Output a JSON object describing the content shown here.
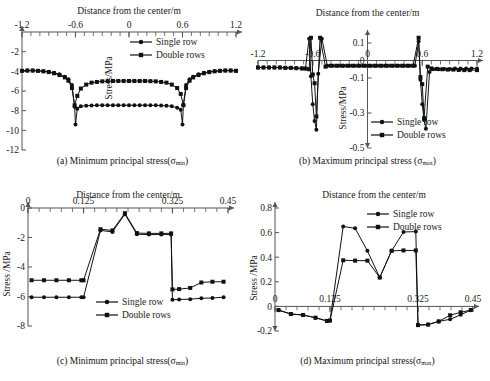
{
  "figure": {
    "background": "#ffffff",
    "line_color": "#111111",
    "axis_color": "#555555",
    "marker_single": "circle",
    "marker_double": "square"
  },
  "legend": {
    "single": "Single row",
    "double": "Double rows"
  },
  "captions": {
    "a": "(a) Minimum principal stress(σ",
    "a_sub": "min",
    "a_end": ")",
    "b": "(b) Maximum principal stress (σ",
    "b_sub": "max",
    "b_end": ")",
    "c": "(c) Minimum principal stress(σ",
    "c_sub": "min",
    "c_end": ")",
    "d": "(d) Maximum principal stress(σ",
    "d_sub": "max",
    "d_end": ")"
  },
  "chart_data": [
    {
      "id": "a",
      "type": "line",
      "title": "Distance from the center/m",
      "xlabel": "Distance from the center/m",
      "ylabel": "Stress/MPa",
      "xlim": [
        -1.2,
        1.2
      ],
      "ylim": [
        -12,
        0
      ],
      "xticks": [
        -1.2,
        -0.6,
        0,
        0.6,
        1.2
      ],
      "xticklabels": [
        "-1.2",
        "-0.6",
        "0",
        "0.6",
        "1.2"
      ],
      "yticks": [
        -2,
        -4,
        -6,
        -8,
        -10,
        -12
      ],
      "yticklabels": [
        "-2",
        "-4",
        "-6",
        "-8",
        "-10",
        "-12"
      ],
      "grid": false,
      "legend_position": "top-right-inside",
      "axis_style": "x-axis-on-top-arrow",
      "series": [
        {
          "name": "Single row",
          "marker": "circle",
          "x": [
            -1.2,
            -1.14,
            -1.08,
            -1.02,
            -0.96,
            -0.9,
            -0.84,
            -0.78,
            -0.72,
            -0.68,
            -0.64,
            -0.61,
            -0.6,
            -0.58,
            -0.54,
            -0.48,
            -0.42,
            -0.36,
            -0.3,
            -0.24,
            -0.18,
            -0.12,
            -0.06,
            0.0,
            0.06,
            0.12,
            0.18,
            0.24,
            0.3,
            0.36,
            0.42,
            0.48,
            0.54,
            0.58,
            0.6,
            0.61,
            0.64,
            0.68,
            0.72,
            0.78,
            0.84,
            0.9,
            0.96,
            1.02,
            1.08,
            1.14,
            1.2
          ],
          "y": [
            -3.95,
            -3.92,
            -3.92,
            -3.95,
            -4.0,
            -4.05,
            -4.15,
            -4.3,
            -4.55,
            -4.8,
            -5.4,
            -7.6,
            -9.4,
            -7.8,
            -7.55,
            -7.5,
            -7.48,
            -7.46,
            -7.45,
            -7.45,
            -7.45,
            -7.45,
            -7.45,
            -7.45,
            -7.45,
            -7.45,
            -7.45,
            -7.45,
            -7.46,
            -7.48,
            -7.5,
            -7.55,
            -7.7,
            -7.9,
            -9.4,
            -7.4,
            -5.4,
            -4.8,
            -4.55,
            -4.3,
            -4.15,
            -4.05,
            -4.0,
            -3.95,
            -3.92,
            -3.92,
            -3.95
          ]
        },
        {
          "name": "Double rows",
          "marker": "square",
          "x": [
            -1.2,
            -1.14,
            -1.08,
            -1.02,
            -0.96,
            -0.9,
            -0.84,
            -0.78,
            -0.72,
            -0.68,
            -0.64,
            -0.61,
            -0.58,
            -0.54,
            -0.48,
            -0.42,
            -0.36,
            -0.3,
            -0.24,
            -0.18,
            -0.12,
            -0.06,
            0.0,
            0.06,
            0.12,
            0.18,
            0.24,
            0.3,
            0.36,
            0.42,
            0.48,
            0.54,
            0.58,
            0.61,
            0.64,
            0.68,
            0.72,
            0.78,
            0.84,
            0.9,
            0.96,
            1.02,
            1.08,
            1.14,
            1.2
          ],
          "y": [
            -3.95,
            -3.92,
            -3.92,
            -3.95,
            -4.0,
            -4.08,
            -4.2,
            -4.38,
            -4.62,
            -4.95,
            -5.7,
            -7.45,
            -6.5,
            -5.75,
            -5.35,
            -5.15,
            -5.08,
            -5.02,
            -5.0,
            -4.98,
            -4.98,
            -4.98,
            -4.98,
            -4.98,
            -4.98,
            -4.98,
            -5.0,
            -5.02,
            -5.08,
            -5.15,
            -5.35,
            -5.7,
            -6.3,
            -7.45,
            -5.7,
            -4.95,
            -4.62,
            -4.38,
            -4.2,
            -4.08,
            -4.0,
            -3.95,
            -3.92,
            -3.92,
            -3.95
          ]
        }
      ]
    },
    {
      "id": "b",
      "type": "line",
      "title": "Distance from the center/m",
      "xlabel": "Distance from the center/m",
      "ylabel": "Stress/MPa",
      "xlim": [
        -1.2,
        1.2
      ],
      "ylim": [
        -0.5,
        0.14
      ],
      "xticks": [
        -1.2,
        -0.6,
        0,
        0.6,
        1.2
      ],
      "xticklabels": [
        "-1.2",
        "-0.6",
        "0",
        "0.6",
        "1.2"
      ],
      "yticks": [
        0.1,
        0,
        -0.1,
        -0.3,
        -0.5
      ],
      "yticklabels": [
        "0.1",
        "0",
        "-0.1",
        "-0.3",
        "-0.5"
      ],
      "grid": false,
      "legend_position": "bottom-right-inside",
      "axis_style": "x-axis-at-zero-arrow",
      "series": [
        {
          "name": "Single row",
          "marker": "circle",
          "x": [
            -1.2,
            -1.14,
            -1.08,
            -1.02,
            -0.96,
            -0.9,
            -0.84,
            -0.78,
            -0.72,
            -0.68,
            -0.64,
            -0.62,
            -0.6,
            -0.58,
            -0.56,
            -0.54,
            -0.5,
            -0.44,
            -0.38,
            -0.32,
            -0.26,
            -0.2,
            -0.14,
            -0.08,
            -0.02,
            0.04,
            0.1,
            0.16,
            0.22,
            0.28,
            0.34,
            0.4,
            0.46,
            0.52,
            0.56,
            0.58,
            0.6,
            0.62,
            0.64,
            0.68,
            0.72,
            0.78,
            0.84,
            0.9,
            0.96,
            1.02,
            1.08,
            1.14,
            1.2
          ],
          "y": [
            -0.04,
            -0.04,
            -0.04,
            -0.04,
            -0.04,
            -0.042,
            -0.042,
            -0.044,
            -0.045,
            -0.046,
            0.125,
            -0.09,
            -0.25,
            -0.345,
            -0.395,
            -0.075,
            0.125,
            -0.03,
            -0.03,
            -0.03,
            -0.03,
            -0.03,
            -0.03,
            -0.03,
            -0.03,
            -0.03,
            -0.03,
            -0.03,
            -0.03,
            -0.03,
            -0.03,
            -0.03,
            -0.03,
            -0.03,
            0.11,
            -0.11,
            -0.25,
            -0.34,
            -0.39,
            -0.065,
            -0.05,
            -0.05,
            -0.048,
            -0.048,
            -0.046,
            -0.046,
            -0.045,
            -0.045,
            -0.045
          ]
        },
        {
          "name": "Double rows",
          "marker": "square",
          "x": [
            -1.2,
            -1.14,
            -1.08,
            -1.02,
            -0.96,
            -0.9,
            -0.84,
            -0.78,
            -0.72,
            -0.68,
            -0.64,
            -0.62,
            -0.6,
            -0.58,
            -0.56,
            -0.52,
            -0.46,
            -0.4,
            -0.34,
            -0.28,
            -0.22,
            -0.16,
            -0.1,
            -0.04,
            0.02,
            0.08,
            0.14,
            0.2,
            0.26,
            0.32,
            0.38,
            0.44,
            0.5,
            0.56,
            0.58,
            0.6,
            0.62,
            0.66,
            0.7,
            0.76,
            0.82,
            0.88,
            0.94,
            1.0,
            1.06,
            1.12,
            1.2
          ],
          "y": [
            -0.04,
            -0.04,
            -0.04,
            -0.04,
            -0.04,
            -0.042,
            -0.042,
            -0.044,
            -0.045,
            -0.046,
            -0.05,
            0.13,
            -0.08,
            -0.13,
            -0.32,
            0.13,
            -0.035,
            -0.03,
            -0.03,
            -0.03,
            -0.03,
            -0.03,
            -0.03,
            -0.03,
            -0.03,
            -0.03,
            -0.03,
            -0.03,
            -0.03,
            -0.03,
            -0.03,
            -0.03,
            -0.03,
            0.13,
            -0.095,
            -0.135,
            -0.33,
            -0.035,
            -0.045,
            -0.048,
            -0.05,
            -0.052,
            -0.052,
            -0.054,
            -0.055,
            -0.055,
            -0.055
          ]
        }
      ]
    },
    {
      "id": "c",
      "type": "line",
      "title": "Distance from the center/m",
      "xlabel": "Distance from the center/m",
      "ylabel": "Stress /MPa",
      "xlim": [
        0,
        0.45
      ],
      "ylim": [
        -8,
        0
      ],
      "xticks": [
        0,
        0.125,
        0.325,
        0.45
      ],
      "xticklabels": [
        "0",
        "0.125",
        "0.325",
        "0.45"
      ],
      "yticks": [
        0,
        -2,
        -4,
        -6,
        -8
      ],
      "yticklabels": [
        "0",
        "-2",
        "-4",
        "-6",
        "-8"
      ],
      "grid": false,
      "legend_position": "bottom-center-inside",
      "axis_style": "x-axis-on-top-arrow",
      "series": [
        {
          "name": "Single row",
          "marker": "circle",
          "x": [
            0.008,
            0.036,
            0.064,
            0.092,
            0.12,
            0.125,
            0.163,
            0.19,
            0.218,
            0.245,
            0.272,
            0.3,
            0.322,
            0.325,
            0.34,
            0.365,
            0.39,
            0.415,
            0.44
          ],
          "y": [
            -6.05,
            -6.05,
            -6.05,
            -6.05,
            -6.05,
            -6.05,
            -1.52,
            -1.62,
            -0.42,
            -1.78,
            -1.8,
            -1.8,
            -1.8,
            -6.22,
            -6.2,
            -6.18,
            -6.12,
            -6.1,
            -6.05
          ]
        },
        {
          "name": "Double rows",
          "marker": "square",
          "x": [
            0.008,
            0.036,
            0.064,
            0.092,
            0.12,
            0.125,
            0.163,
            0.19,
            0.218,
            0.245,
            0.272,
            0.3,
            0.322,
            0.325,
            0.34,
            0.365,
            0.39,
            0.415,
            0.44
          ],
          "y": [
            -4.9,
            -4.9,
            -4.9,
            -4.9,
            -4.9,
            -4.9,
            -1.44,
            -1.52,
            -0.35,
            -1.7,
            -1.72,
            -1.72,
            -1.72,
            -5.52,
            -5.5,
            -5.42,
            -5.05,
            -5.0,
            -5.0
          ]
        }
      ]
    },
    {
      "id": "d",
      "type": "line",
      "title": "Distance from the center/m",
      "xlabel": "Distance from the center/m",
      "ylabel": "Stress /MPa",
      "xlim": [
        0,
        0.45
      ],
      "ylim": [
        -0.2,
        0.8
      ],
      "xticks": [
        0,
        0.125,
        0.325,
        0.45
      ],
      "xticklabels": [
        "0",
        "0.125",
        "0.325",
        "0.45"
      ],
      "yticks": [
        0.8,
        0.6,
        0.4,
        0.2,
        0,
        -0.2
      ],
      "yticklabels": [
        "0.8",
        "0.6",
        "0.4",
        "0.2",
        "0",
        "-0.2"
      ],
      "grid": false,
      "legend_position": "top-right-inside",
      "axis_style": "x-axis-at-zero-arrow",
      "series": [
        {
          "name": "Single row",
          "marker": "circle",
          "x": [
            0.008,
            0.036,
            0.064,
            0.092,
            0.118,
            0.125,
            0.155,
            0.182,
            0.21,
            0.238,
            0.265,
            0.292,
            0.32,
            0.325,
            0.348,
            0.372,
            0.398,
            0.422,
            0.445
          ],
          "y": [
            -0.03,
            -0.062,
            -0.07,
            -0.092,
            -0.118,
            -0.115,
            0.65,
            0.635,
            0.452,
            0.235,
            0.452,
            0.605,
            0.608,
            -0.152,
            -0.148,
            -0.122,
            -0.105,
            -0.068,
            -0.03
          ]
        },
        {
          "name": "Double rows",
          "marker": "square",
          "x": [
            0.008,
            0.036,
            0.064,
            0.092,
            0.118,
            0.125,
            0.155,
            0.182,
            0.21,
            0.238,
            0.265,
            0.292,
            0.32,
            0.325,
            0.348,
            0.372,
            0.398,
            0.422,
            0.445
          ],
          "y": [
            -0.03,
            -0.062,
            -0.07,
            -0.092,
            -0.118,
            -0.115,
            0.375,
            0.372,
            0.372,
            0.235,
            0.452,
            0.455,
            0.455,
            -0.152,
            -0.148,
            -0.122,
            -0.072,
            -0.048,
            -0.03
          ]
        }
      ]
    }
  ]
}
